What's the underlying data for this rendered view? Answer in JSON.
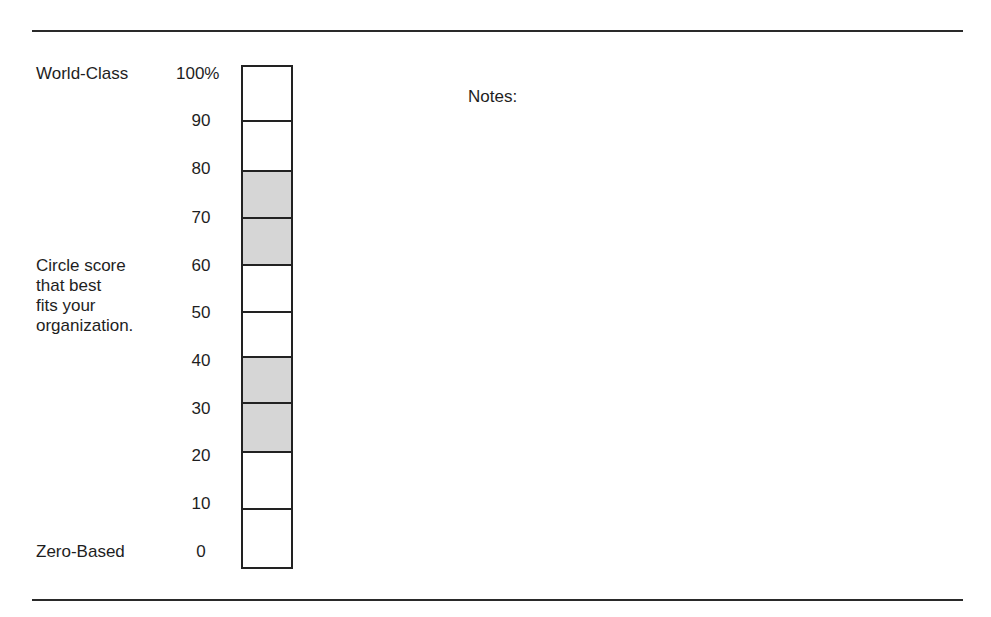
{
  "anchors": {
    "top_label": "World-Class",
    "bottom_label": "Zero-Based"
  },
  "instruction": {
    "lines": [
      "Circle score",
      "that best",
      "fits your",
      "organization."
    ]
  },
  "scale": {
    "labels": [
      "100%",
      "90",
      "80",
      "70",
      "60",
      "50",
      "40",
      "30",
      "20",
      "10",
      "0"
    ]
  },
  "bar": {
    "shaded_color": "#d6d6d6",
    "border_color": "#222222",
    "segments": [
      {
        "from": 90,
        "to": 100,
        "shaded": false
      },
      {
        "from": 80,
        "to": 90,
        "shaded": false
      },
      {
        "from": 70,
        "to": 80,
        "shaded": true
      },
      {
        "from": 60,
        "to": 70,
        "shaded": true
      },
      {
        "from": 50,
        "to": 60,
        "shaded": false
      },
      {
        "from": 40,
        "to": 50,
        "shaded": false
      },
      {
        "from": 30,
        "to": 40,
        "shaded": true
      },
      {
        "from": 20,
        "to": 30,
        "shaded": true
      },
      {
        "from": 10,
        "to": 20,
        "shaded": false
      },
      {
        "from": 0,
        "to": 10,
        "shaded": false
      }
    ]
  },
  "notes": {
    "label": "Notes:"
  }
}
